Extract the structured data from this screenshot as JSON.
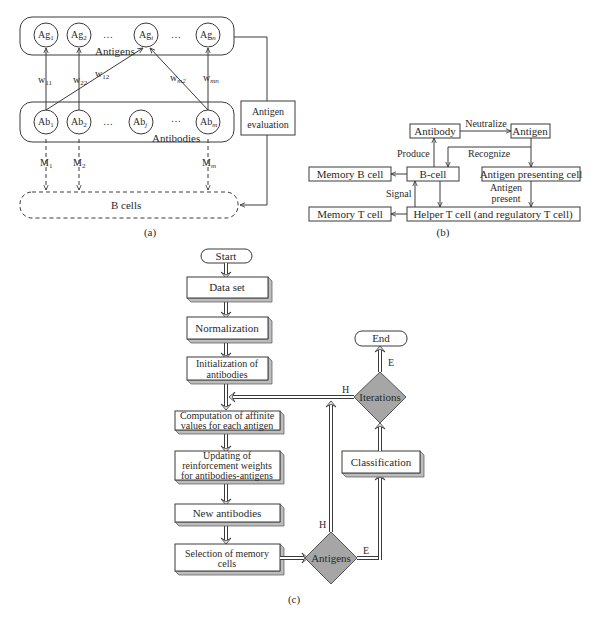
{
  "panel_a": {
    "caption": "(a)",
    "antigens": {
      "group_label": "Antigens",
      "nodes": [
        {
          "base": "Ag",
          "sub": "1"
        },
        {
          "base": "Ag",
          "sub": "2"
        },
        {
          "base": "Ag",
          "sub": "i"
        },
        {
          "base": "Ag",
          "sub": "n"
        }
      ],
      "ellipsis": "…"
    },
    "antibodies": {
      "group_label": "Antibodies",
      "nodes": [
        {
          "base": "Ab",
          "sub": "1"
        },
        {
          "base": "Ab",
          "sub": "2"
        },
        {
          "base": "Ab",
          "sub": "j"
        },
        {
          "base": "Ab",
          "sub": "m"
        }
      ],
      "ellipsis": "…"
    },
    "weights": [
      {
        "base": "w",
        "sub": "11"
      },
      {
        "base": "w",
        "sub": "22"
      },
      {
        "base": "w",
        "sub": "12"
      },
      {
        "base": "w",
        "sub": "m2"
      },
      {
        "base": "w",
        "sub": "mn"
      }
    ],
    "memory_links": [
      {
        "base": "M",
        "sub": "1"
      },
      {
        "base": "M",
        "sub": "2"
      },
      {
        "base": "M",
        "sub": "m"
      }
    ],
    "b_cells_label": "B cells",
    "evaluation_box": {
      "line1": "Antigen",
      "line2": "evaluation"
    }
  },
  "panel_b": {
    "caption": "(b)",
    "boxes": {
      "antibody": "Antibody",
      "antigen": "Antigen",
      "memory_b": "Memory B cell",
      "b_cell": "B-cell",
      "apc": "Antigen presenting cell",
      "memory_t": "Memory T cell",
      "helper_t": "Helper T cell (and regulatory T cell)"
    },
    "edge_labels": {
      "neutralize": "Neutralize",
      "produce": "Produce",
      "recognize": "Recognize",
      "signal": "Signal",
      "antigen_present_1": "Antigen",
      "antigen_present_2": "present"
    }
  },
  "panel_c": {
    "caption": "(c)",
    "start": "Start",
    "end": "End",
    "steps": {
      "data_set": "Data set",
      "normalization": "Normalization",
      "init_1": "Initialization of",
      "init_2": "antibodies",
      "comp_1": "Computation of affinite",
      "comp_2": "values for each antigen",
      "upd_1": "Updating of",
      "upd_2": "reinforcement weights",
      "upd_3": "for antibodies-antigens",
      "new_ab": "New antibodies",
      "sel_1": "Selection of memory",
      "sel_2": "cells",
      "classification": "Classification"
    },
    "decisions": {
      "antigens": "Antigens",
      "iterations": "Iterations"
    },
    "branch_labels": {
      "antigens_h": "H",
      "antigens_e": "E",
      "iterations_h": "H",
      "iterations_e": "E"
    },
    "colors": {
      "decision_fill": "#a6a6a6",
      "box_shadow": "#bdbdbd"
    }
  }
}
